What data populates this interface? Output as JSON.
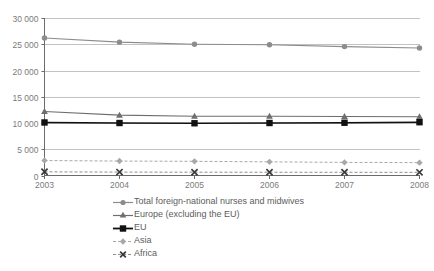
{
  "chart_data": {
    "type": "line",
    "title": "",
    "subtitle": "",
    "xlabel": "",
    "ylabel": "",
    "categories": [
      "2003",
      "2004",
      "2005",
      "2006",
      "2007",
      "2008"
    ],
    "x": [
      2003,
      2004,
      2005,
      2006,
      2007,
      2008
    ],
    "ylim": [
      0,
      30000
    ],
    "yticks": [
      0,
      5000,
      10000,
      15000,
      20000,
      25000,
      30000
    ],
    "ytick_labels": [
      "0",
      "5 000",
      "10 000",
      "15 000",
      "20 000",
      "25 000",
      "30 000"
    ],
    "xtick_labels": [
      "2003",
      "2004",
      "2005",
      "2006",
      "2007",
      "2008"
    ],
    "grid": true,
    "grid_axis": "y",
    "legend_position": "bottom-left",
    "series": [
      {
        "name": "Total foreign-national nurses and midwives",
        "key": "total",
        "values": [
          26200,
          25400,
          25000,
          24900,
          24550,
          24300
        ],
        "color": "#8c8c8c",
        "marker": "circle",
        "line_style": "solid",
        "line_width": 1.1
      },
      {
        "name": "Europe (excluding the EU)",
        "key": "europe_non_eu",
        "values": [
          12200,
          11500,
          11300,
          11300,
          11250,
          11200
        ],
        "color": "#6e6e6e",
        "marker": "triangle",
        "line_style": "solid",
        "line_width": 1.1
      },
      {
        "name": "EU",
        "key": "eu",
        "values": [
          10100,
          10000,
          9950,
          10000,
          10050,
          10150
        ],
        "color": "#111111",
        "marker": "square",
        "line_style": "solid",
        "line_width": 1.6
      },
      {
        "name": "Asia",
        "key": "asia",
        "values": [
          2850,
          2750,
          2700,
          2600,
          2500,
          2450
        ],
        "color": "#a8a8a8",
        "marker": "diamond",
        "line_style": "dashed",
        "line_width": 1.0
      },
      {
        "name": "Africa",
        "key": "africa",
        "values": [
          700,
          650,
          630,
          620,
          610,
          600
        ],
        "color": "#8e8e8e",
        "marker": "cross",
        "line_style": "dashed",
        "line_width": 1.0
      }
    ],
    "colors": {
      "axis": "#6b6b6b",
      "grid": "#b3b3b3",
      "tick_text": "#7b7b7b",
      "legend_text": "#5d5d5d",
      "background": "#ffffff"
    }
  },
  "legend": {
    "items": [
      {
        "label": "Total foreign-national nurses and midwives",
        "marker": "circle-line-marker"
      },
      {
        "label": "Europe (excluding the EU)",
        "marker": "triangle-line-marker"
      },
      {
        "label": "EU",
        "marker": "square-line-marker"
      },
      {
        "label": "Asia",
        "marker": "diamond-dashed-line-marker"
      },
      {
        "label": "Africa",
        "marker": "cross-dashed-line-marker"
      }
    ]
  }
}
